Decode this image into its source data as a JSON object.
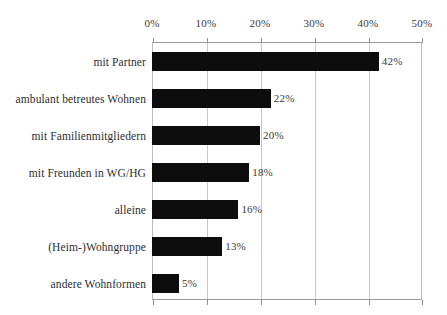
{
  "chart_data": {
    "type": "bar",
    "orientation": "horizontal",
    "title": "",
    "subtitle": "",
    "xlabel": "",
    "ylabel": "",
    "xlim": [
      0,
      50
    ],
    "xticks": [
      0,
      10,
      20,
      30,
      40,
      50
    ],
    "xtick_labels": [
      "0%",
      "10%",
      "20%",
      "30%",
      "40%",
      "50%"
    ],
    "grid": "vertical",
    "legend": "none",
    "value_suffix": "%",
    "bar_color": "#0d0d0d",
    "gridline_color": "#c9c9c9",
    "axis_color": "#9a9a9a",
    "background_color": "#ffffff",
    "categories": [
      "mit Partner",
      "ambulant betreutes Wohnen",
      "mit Familienmitgliedern",
      "mit Freunden in WG/HG",
      "alleine",
      "(Heim-)Wohngruppe",
      "andere Wohnformen"
    ],
    "values": [
      42,
      22,
      20,
      18,
      16,
      13,
      5
    ],
    "data_labels": [
      "42%",
      "22%",
      "20%",
      "18%",
      "16%",
      "13%",
      "5%"
    ]
  }
}
